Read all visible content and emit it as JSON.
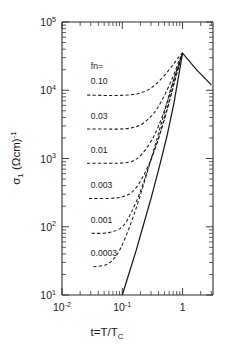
{
  "chart_data": {
    "type": "line",
    "title": "",
    "xlabel": "t=T/T_C",
    "xlabel_parts": {
      "main": "t=T/T",
      "sub": "C"
    },
    "ylabel": "σ₁ (Ωcm)⁻¹",
    "ylabel_parts": {
      "sigma": "σ",
      "sigma_sub": "1",
      "unit": "(Ωcm)",
      "unit_sup": "-1"
    },
    "xscale": "log",
    "yscale": "log",
    "xlim": [
      0.01,
      3.2
    ],
    "ylim": [
      10,
      100000
    ],
    "grid": false,
    "legend_position": "inside-left",
    "legend_title": "fn=",
    "x_ticks": [
      {
        "value": 0.01,
        "mantissa": "10",
        "exponent": "-2",
        "label": "10⁻²"
      },
      {
        "value": 0.1,
        "mantissa": "10",
        "exponent": "-1",
        "label": "10⁻¹"
      },
      {
        "value": 1,
        "mantissa": "1",
        "exponent": "",
        "label": "1"
      }
    ],
    "y_ticks": [
      {
        "value": 10,
        "mantissa": "10",
        "exponent": "1",
        "label": "10¹"
      },
      {
        "value": 100,
        "mantissa": "10",
        "exponent": "2",
        "label": "10²"
      },
      {
        "value": 1000,
        "mantissa": "10",
        "exponent": "3",
        "label": "10³"
      },
      {
        "value": 10000,
        "mantissa": "10",
        "exponent": "4",
        "label": "10⁴"
      },
      {
        "value": 100000,
        "mantissa": "10",
        "exponent": "5",
        "label": "10⁵"
      }
    ],
    "series": [
      {
        "name": "envelope",
        "label": "",
        "style": "solid",
        "x": [
          0.1,
          0.13,
          0.17,
          0.22,
          0.3,
          0.4,
          0.55,
          0.72,
          1.0,
          1.7,
          3.0
        ],
        "y": [
          10,
          21,
          45,
          100,
          260,
          680,
          2100,
          6500,
          35000,
          20000,
          12000
        ]
      },
      {
        "name": "fn-0.10",
        "label": "0.10",
        "style": "dashed",
        "plateau": 8500,
        "x": [
          0.026,
          0.05,
          0.08,
          0.12,
          0.18,
          0.26,
          0.35,
          0.5,
          0.68,
          0.85,
          1.0
        ],
        "y": [
          8500,
          8400,
          8400,
          8500,
          8900,
          10000,
          12000,
          16500,
          23000,
          30000,
          35000
        ]
      },
      {
        "name": "fn-0.03",
        "label": "0.03",
        "style": "dashed",
        "plateau": 2700,
        "x": [
          0.026,
          0.05,
          0.09,
          0.14,
          0.2,
          0.28,
          0.38,
          0.52,
          0.7,
          0.86,
          1.0
        ],
        "y": [
          2700,
          2700,
          2700,
          2800,
          3100,
          3900,
          5400,
          9000,
          16000,
          26000,
          35000
        ]
      },
      {
        "name": "fn-0.01",
        "label": "0.01",
        "style": "dashed",
        "plateau": 850,
        "x": [
          0.026,
          0.06,
          0.1,
          0.15,
          0.21,
          0.3,
          0.4,
          0.55,
          0.72,
          0.88,
          1.0
        ],
        "y": [
          850,
          850,
          860,
          920,
          1150,
          1800,
          3000,
          6500,
          14500,
          25000,
          35000
        ]
      },
      {
        "name": "fn-0.003",
        "label": "0.003",
        "style": "dashed",
        "plateau": 260,
        "x": [
          0.028,
          0.06,
          0.1,
          0.15,
          0.22,
          0.31,
          0.42,
          0.57,
          0.74,
          0.89,
          1.0
        ],
        "y": [
          260,
          260,
          275,
          330,
          540,
          1050,
          2250,
          5600,
          13500,
          24500,
          35000
        ]
      },
      {
        "name": "fn-0.001",
        "label": "0.001",
        "style": "dashed",
        "plateau": 80,
        "x": [
          0.031,
          0.06,
          0.1,
          0.14,
          0.2,
          0.28,
          0.4,
          0.55,
          0.73,
          0.89,
          1.0
        ],
        "y": [
          80,
          82,
          100,
          160,
          330,
          800,
          2000,
          5300,
          13200,
          24500,
          35000
        ]
      },
      {
        "name": "fn-0.0003",
        "label": "0.0003",
        "style": "dashed",
        "plateau": 26,
        "x": [
          0.033,
          0.055,
          0.08,
          0.11,
          0.16,
          0.23,
          0.33,
          0.47,
          0.65,
          0.85,
          1.0
        ],
        "y": [
          26,
          28,
          38,
          66,
          160,
          440,
          1300,
          3900,
          11000,
          23000,
          35000
        ]
      }
    ],
    "annotations": [
      {
        "text": "fn=",
        "x": 0.03,
        "y": 20500,
        "name": "legend-title"
      },
      {
        "text": "0.10",
        "x": 0.03,
        "y": 12500,
        "name": "series-label-0.10"
      },
      {
        "text": "0.03",
        "x": 0.03,
        "y": 3800,
        "name": "series-label-0.03"
      },
      {
        "text": "0.01",
        "x": 0.03,
        "y": 1200,
        "name": "series-label-0.01"
      },
      {
        "text": "0.003",
        "x": 0.03,
        "y": 370,
        "name": "series-label-0.003"
      },
      {
        "text": "0.001",
        "x": 0.03,
        "y": 112,
        "name": "series-label-0.001"
      },
      {
        "text": "0.0003",
        "x": 0.03,
        "y": 37,
        "name": "series-label-0.0003"
      }
    ]
  }
}
